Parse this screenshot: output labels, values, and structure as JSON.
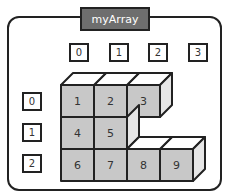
{
  "diagram": {
    "title": "myArray",
    "column_indices": [
      "0",
      "1",
      "2",
      "3"
    ],
    "row_indices": [
      "0",
      "1",
      "2"
    ],
    "cells": [
      {
        "row": 0,
        "col": 0,
        "value": "1"
      },
      {
        "row": 0,
        "col": 1,
        "value": "2"
      },
      {
        "row": 0,
        "col": 2,
        "value": "3"
      },
      {
        "row": 1,
        "col": 0,
        "value": "4"
      },
      {
        "row": 1,
        "col": 1,
        "value": "5"
      },
      {
        "row": 2,
        "col": 0,
        "value": "6"
      },
      {
        "row": 2,
        "col": 1,
        "value": "7"
      },
      {
        "row": 2,
        "col": 2,
        "value": "8"
      },
      {
        "row": 2,
        "col": 3,
        "value": "9"
      }
    ],
    "colors": {
      "front": "#c8c8c8",
      "top": "#ffffff",
      "side": "#e6e6e6",
      "title_bg": "#6e6e6e",
      "stroke": "#222222"
    }
  }
}
